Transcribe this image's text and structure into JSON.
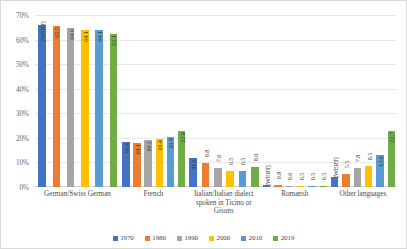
{
  "chart_data": {
    "type": "bar",
    "title": "",
    "xlabel": "",
    "ylabel": "",
    "ylim": [
      0,
      70
    ],
    "ytick_labels": [
      "0%",
      "10%",
      "20%",
      "30%",
      "40%",
      "50%",
      "60%",
      "70%"
    ],
    "ytick_values": [
      0,
      10,
      20,
      30,
      40,
      50,
      60,
      70
    ],
    "grid": true,
    "legend_position": "bottom",
    "categories": [
      "German/Swiss German",
      "French",
      "Italian/Italian dialect spoken in Ticino or Gisons",
      "Romansh",
      "Other languages"
    ],
    "series": [
      {
        "name": "1970",
        "color": "#4472c4",
        "values": [
          66.1,
          18.4,
          11.9,
          0.8,
          4.0
        ],
        "labels": [
          "[WERT]",
          "18.4",
          "11.9",
          "[WERT]",
          "[WERT]"
        ]
      },
      {
        "name": "1980",
        "color": "#ed7d31",
        "values": [
          65.5,
          18.1,
          9.8,
          0.8,
          5.5
        ],
        "labels": [
          "65.5",
          "18.1",
          "9.8",
          "0.8",
          "5.5"
        ]
      },
      {
        "name": "1990",
        "color": "#a5a5a5",
        "values": [
          64.6,
          19.2,
          7.6,
          0.6,
          7.8
        ],
        "labels": [
          "64.6",
          "19.2",
          "7.6",
          "0.6",
          "7.8"
        ]
      },
      {
        "name": "2000",
        "color": "#ffc000",
        "values": [
          64.1,
          19.4,
          6.5,
          0.5,
          8.5
        ],
        "labels": [
          "64.1",
          "19.4",
          "6.5",
          "0.5",
          "8.5"
        ]
      },
      {
        "name": "2010",
        "color": "#5b9bd5",
        "values": [
          64.1,
          20.4,
          6.5,
          0.5,
          13.0
        ],
        "labels": [
          "64.1",
          "20.4",
          "6.5",
          "0.5",
          "13.0"
        ]
      },
      {
        "name": "2019",
        "color": "#70ad47",
        "values": [
          62.1,
          22.8,
          8.0,
          0.5,
          22.7
        ],
        "labels": [
          "62.1",
          "22.8",
          "8.0",
          "0.5",
          "22.7"
        ]
      }
    ]
  }
}
